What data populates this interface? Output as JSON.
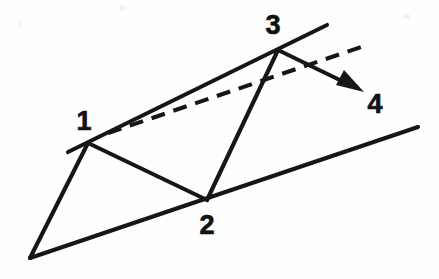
{
  "figure": {
    "background_color": "#fefefe",
    "ink_color": "#161616",
    "width": 439,
    "height": 279,
    "labels": [
      {
        "id": "label-1",
        "text": "1",
        "x": 84,
        "y": 130
      },
      {
        "id": "label-2",
        "text": "2",
        "x": 199,
        "y": 231
      },
      {
        "id": "label-3",
        "text": "3",
        "x": 266,
        "y": 36
      },
      {
        "id": "label-4",
        "text": "4",
        "x": 364,
        "y": 112
      }
    ],
    "points": {
      "apex": {
        "x": 30,
        "y": 258
      },
      "p1": {
        "x": 88,
        "y": 143
      },
      "p2": {
        "x": 207,
        "y": 200
      },
      "p3": {
        "x": 278,
        "y": 50
      },
      "p4": {
        "x": 362,
        "y": 91
      }
    },
    "strokes": [
      {
        "id": "upper-ray",
        "kind": "solid",
        "description": "long upper line through point 1 and point 3",
        "x1": 68,
        "y1": 152,
        "x2": 327,
        "y2": 25
      },
      {
        "id": "lower-ray",
        "kind": "solid",
        "description": "long lower line from bottom-left apex through point 2",
        "x1": 30,
        "y1": 258,
        "x2": 418,
        "y2": 127
      },
      {
        "id": "apex-to-p1",
        "kind": "solid",
        "description": "line from bottom-left apex up to point 1",
        "x1": 30,
        "y1": 258,
        "x2": 88,
        "y2": 143
      },
      {
        "id": "p1-to-p2",
        "kind": "solid",
        "description": "line from point 1 down to point 2",
        "x1": 88,
        "y1": 143,
        "x2": 207,
        "y2": 200
      },
      {
        "id": "p2-to-p3",
        "kind": "solid",
        "description": "line from point 2 up to point 3",
        "x1": 207,
        "y1": 200,
        "x2": 278,
        "y2": 50
      },
      {
        "id": "dashed-chord",
        "kind": "dashed",
        "description": "dashed line from point 1 rising to the right past point 3",
        "x1": 108,
        "y1": 133,
        "x2": 361,
        "y2": 47
      },
      {
        "id": "arrow-p3-to-p4",
        "kind": "arrow",
        "description": "solid arrow from point 3 pointing down-right to label 4",
        "x1": 278,
        "y1": 50,
        "x2": 362,
        "y2": 91
      }
    ]
  }
}
